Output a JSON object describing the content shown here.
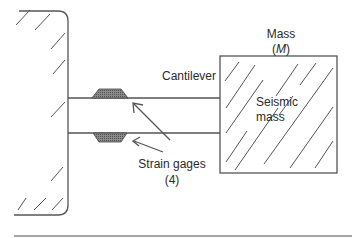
{
  "diagram": {
    "type": "cantilever accelerometer schematic",
    "labels": {
      "mass_line1": "Mass",
      "mass_line2_open": "(",
      "mass_symbol": "M",
      "mass_line2_close": ")",
      "cantilever": "Cantilever",
      "seismic_line1": "Seismic",
      "seismic_line2": "mass",
      "gages_line1": "Strain gages",
      "gages_line2": "(4)"
    },
    "colors": {
      "line": "#555555",
      "gage_fill": "#7a7a7a",
      "text": "#2a2a2a"
    }
  }
}
